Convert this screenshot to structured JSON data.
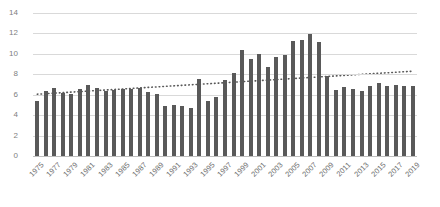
{
  "chart_data": {
    "type": "bar",
    "title": "",
    "subtitle": "",
    "xlabel": "",
    "ylabel": "",
    "ylim": [
      0,
      14
    ],
    "y_ticks": [
      0,
      2,
      4,
      6,
      8,
      10,
      12,
      14
    ],
    "grid": true,
    "legend": "none",
    "x_tick_labels": [
      "1975",
      "1977",
      "1979",
      "1981",
      "1983",
      "1985",
      "1987",
      "1989",
      "1991",
      "1993",
      "1995",
      "1997",
      "1999",
      "2001",
      "2003",
      "2005",
      "2007",
      "2009",
      "2011",
      "2013",
      "2015",
      "2017",
      "2019"
    ],
    "categories": [
      "1975",
      "1976",
      "1977",
      "1978",
      "1979",
      "1980",
      "1981",
      "1982",
      "1983",
      "1984",
      "1985",
      "1986",
      "1987",
      "1988",
      "1989",
      "1990",
      "1991",
      "1992",
      "1993",
      "1994",
      "1995",
      "1996",
      "1997",
      "1998",
      "1999",
      "2000",
      "2001",
      "2002",
      "2003",
      "2004",
      "2005",
      "2006",
      "2007",
      "2008",
      "2009",
      "2010",
      "2011",
      "2012",
      "2013",
      "2014",
      "2015",
      "2016",
      "2017",
      "2018",
      "2019"
    ],
    "values": [
      5.4,
      6.4,
      6.7,
      6.2,
      6.1,
      6.6,
      7.0,
      6.7,
      6.4,
      6.5,
      6.6,
      6.6,
      6.7,
      6.3,
      6.1,
      4.9,
      5.0,
      4.9,
      4.7,
      7.5,
      5.4,
      5.8,
      7.4,
      8.1,
      10.4,
      9.5,
      10.0,
      8.7,
      9.7,
      9.9,
      11.3,
      11.4,
      11.9,
      11.2,
      7.8,
      6.5,
      6.8,
      6.6,
      6.4,
      6.9,
      7.1,
      6.9,
      7.0,
      6.9,
      6.9
    ],
    "series_color": "#595959",
    "trendline": {
      "type": "linear-dotted",
      "start_value": 6.05,
      "end_value": 8.3,
      "color": "#595959",
      "style": "dotted"
    }
  }
}
